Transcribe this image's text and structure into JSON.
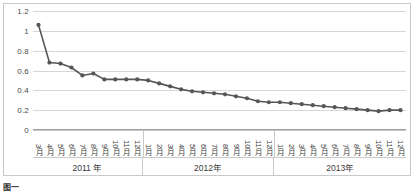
{
  "chart_data": {
    "type": "line",
    "title": "",
    "subtitle": "",
    "xlabel": "",
    "ylabel": "",
    "ylim": [
      0,
      1.2
    ],
    "yticks": [
      "0",
      "0.2",
      "0.4",
      "0.6",
      "0.8",
      "1",
      "1.2"
    ],
    "ytick_values": [
      0,
      0.2,
      0.4,
      0.6,
      0.8,
      1,
      1.2
    ],
    "grid": true,
    "legend": "none",
    "marker": "circle",
    "series_color": "#565656",
    "categories": [
      "3月",
      "4月",
      "5月",
      "6月",
      "7月",
      "8月",
      "9月",
      "10月",
      "11月",
      "12月",
      "1月",
      "2月",
      "3月",
      "4月",
      "5月",
      "6月",
      "7月",
      "8月",
      "9月",
      "10月",
      "11月",
      "12月",
      "1月",
      "2月",
      "3月",
      "4月",
      "5月",
      "6月",
      "7月",
      "8月",
      "9月",
      "10月",
      "11月",
      "12月"
    ],
    "values": [
      1.06,
      0.68,
      0.67,
      0.63,
      0.55,
      0.57,
      0.51,
      0.51,
      0.51,
      0.51,
      0.5,
      0.47,
      0.44,
      0.41,
      0.39,
      0.38,
      0.37,
      0.36,
      0.34,
      0.32,
      0.29,
      0.28,
      0.28,
      0.27,
      0.26,
      0.25,
      0.24,
      0.23,
      0.22,
      0.21,
      0.2,
      0.19,
      0.2,
      0.2
    ],
    "year_groups": [
      {
        "label": "2011 年",
        "count": 10
      },
      {
        "label": "2012年",
        "count": 12
      },
      {
        "label": "2013年",
        "count": 12
      }
    ]
  },
  "caption": {
    "tag": "图一",
    "text": ""
  }
}
